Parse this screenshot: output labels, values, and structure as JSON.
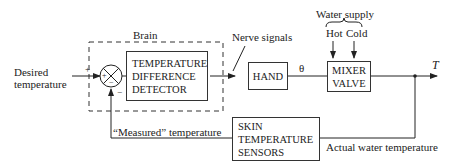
{
  "diagram": {
    "input_label_line1": "Desired",
    "input_label_line2": "temperature",
    "brain_label": "Brain",
    "summing_plus": "+",
    "summing_minus": "−",
    "input_sign": "+",
    "feedback_sign": "−",
    "detector": [
      "TEMPERATURE",
      "DIFFERENCE",
      "DETECTOR"
    ],
    "nerve_signals_label": "Nerve signals",
    "hand_label": "HAND",
    "theta_label": "θ",
    "water_supply_label": "Water supply",
    "hot_label": "Hot",
    "cold_label": "Cold",
    "mixer": [
      "MIXER",
      "VALVE"
    ],
    "output_label": "T",
    "sensors": [
      "SKIN",
      "TEMPERATURE",
      "SENSORS"
    ],
    "measured_label": "“Measured” temperature",
    "actual_label": "Actual water temperature"
  }
}
